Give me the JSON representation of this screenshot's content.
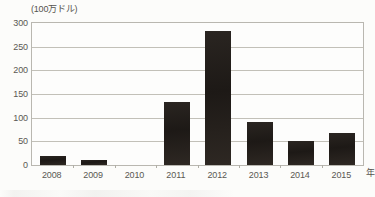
{
  "chart_data": {
    "type": "bar",
    "title": "",
    "subtitle": "",
    "unit_label": "(100万ドル)",
    "xlabel": "年",
    "ylabel": "",
    "categories": [
      "2008",
      "2009",
      "2010",
      "2011",
      "2012",
      "2013",
      "2014",
      "2015"
    ],
    "values": [
      18,
      11,
      0,
      133,
      283,
      90,
      50,
      67
    ],
    "ylim": [
      0,
      300
    ],
    "ytick_values": [
      0,
      50,
      100,
      150,
      200,
      250,
      300
    ],
    "ytick_labels": [
      "0",
      "50",
      "100",
      "150",
      "200",
      "250",
      "300"
    ],
    "grid": true,
    "legend": false,
    "bar_color": "#231f1c",
    "axis_color": "#b9b7b0",
    "gridline_color": "#c2c0b8",
    "text_color": "#5a5852",
    "background_color": "#fcfcfa"
  }
}
